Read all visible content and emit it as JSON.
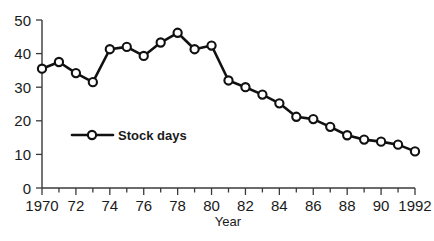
{
  "chart_data": {
    "type": "line",
    "title": "",
    "xlabel": "Year",
    "ylabel": "",
    "xlim": [
      1970,
      1992
    ],
    "ylim": [
      0,
      50
    ],
    "grid": false,
    "legend_position": "inside-lower-left",
    "y_ticks": [
      0,
      10,
      20,
      30,
      40,
      50
    ],
    "y_tick_labels": [
      "0",
      "10",
      "20",
      "30",
      "40",
      "50"
    ],
    "x_ticks": [
      1970,
      1971,
      1972,
      1973,
      1974,
      1975,
      1976,
      1977,
      1978,
      1979,
      1980,
      1981,
      1982,
      1983,
      1984,
      1985,
      1986,
      1987,
      1988,
      1989,
      1990,
      1991,
      1992
    ],
    "x_tick_labels": [
      "1970",
      "",
      "72",
      "",
      "74",
      "",
      "76",
      "",
      "78",
      "",
      "80",
      "",
      "82",
      "",
      "84",
      "",
      "86",
      "",
      "88",
      "",
      "90",
      "",
      "1992"
    ],
    "x": [
      1970,
      1971,
      1972,
      1973,
      1974,
      1975,
      1976,
      1977,
      1978,
      1979,
      1980,
      1981,
      1982,
      1983,
      1984,
      1985,
      1986,
      1987,
      1988,
      1989,
      1990,
      1991,
      1992
    ],
    "series": [
      {
        "name": "Stock days",
        "marker": "open-circle",
        "color": "#111111",
        "values": [
          35.5,
          37.5,
          34.2,
          31.5,
          41.3,
          42.0,
          39.3,
          43.3,
          46.2,
          41.3,
          42.4,
          32.0,
          30.0,
          27.8,
          25.2,
          21.2,
          20.5,
          18.2,
          15.7,
          14.4,
          13.8,
          12.9,
          10.9
        ]
      }
    ],
    "legend": [
      {
        "label": "Stock days"
      }
    ]
  },
  "axes": {
    "x_axis_title": "Year"
  }
}
